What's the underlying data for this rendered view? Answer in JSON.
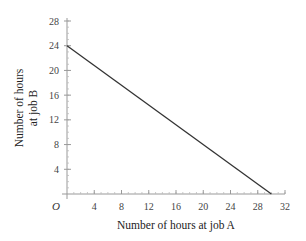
{
  "chart_data": {
    "type": "line",
    "title": "",
    "xlabel": "Number of hours at job A",
    "ylabel_lines": [
      "Number of hours",
      "at job B"
    ],
    "ylabel": "Number of hours at job B",
    "origin_label": "O",
    "xlim": [
      0,
      32
    ],
    "ylim": [
      0,
      28
    ],
    "x_ticks": [
      4,
      8,
      12,
      16,
      20,
      24,
      28,
      32
    ],
    "y_ticks": [
      4,
      8,
      12,
      16,
      20,
      24,
      28
    ],
    "minor_tick_step": 1,
    "grid": false,
    "legend": null,
    "series": [
      {
        "name": "constraint line",
        "x": [
          0,
          30
        ],
        "y": [
          24,
          0
        ]
      }
    ],
    "colors": {
      "axis": "#999999",
      "line": "#333333",
      "text": "#444444"
    }
  }
}
